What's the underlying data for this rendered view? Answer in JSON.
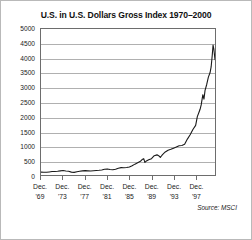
{
  "chart_data": {
    "type": "line",
    "title": "U.S. in U.S. Dollars Gross Index 1970–2000",
    "xlabel": "",
    "ylabel": "",
    "ylim": [
      0,
      5000
    ],
    "ytick_values": [
      0,
      500,
      1000,
      1500,
      2000,
      2500,
      3000,
      3500,
      4000,
      4500,
      5000
    ],
    "ytick_labels": [
      "0",
      "500",
      "1000",
      "1500",
      "2000",
      "2500",
      "3000",
      "3500",
      "4000",
      "4500",
      "5000"
    ],
    "xtick_labels": [
      {
        "line1": "Dec.",
        "line2": "'69"
      },
      {
        "line1": "Dec.",
        "line2": "'73"
      },
      {
        "line1": "Dec.",
        "line2": "'77"
      },
      {
        "line1": "Dec.",
        "line2": "'81"
      },
      {
        "line1": "Dec.",
        "line2": "'85"
      },
      {
        "line1": "Dec.",
        "line2": "'89"
      },
      {
        "line1": "Dec.",
        "line2": "'93"
      },
      {
        "line1": "Dec.",
        "line2": "'97"
      }
    ],
    "xtick_years": [
      1969,
      1973,
      1977,
      1981,
      1985,
      1989,
      1993,
      1997
    ],
    "xlim": [
      1969,
      2000.5
    ],
    "grid": true,
    "legend": false,
    "line_color": "#1a1a1a",
    "annotation": "Source: MSCI",
    "series": [
      {
        "name": "U.S. in U.S. Dollars Gross Index",
        "x": [
          1969.0,
          1969.5,
          1970.0,
          1970.5,
          1971.0,
          1971.5,
          1972.0,
          1972.5,
          1973.0,
          1973.5,
          1974.0,
          1974.5,
          1975.0,
          1975.5,
          1976.0,
          1976.5,
          1977.0,
          1977.5,
          1978.0,
          1978.5,
          1979.0,
          1979.5,
          1980.0,
          1980.5,
          1981.0,
          1981.5,
          1982.0,
          1982.5,
          1983.0,
          1983.5,
          1984.0,
          1984.5,
          1985.0,
          1985.5,
          1986.0,
          1986.5,
          1987.0,
          1987.3,
          1987.6,
          1987.8,
          1988.0,
          1988.5,
          1989.0,
          1989.5,
          1990.0,
          1990.3,
          1990.6,
          1990.8,
          1991.0,
          1991.5,
          1992.0,
          1992.5,
          1993.0,
          1993.5,
          1994.0,
          1994.5,
          1995.0,
          1995.5,
          1996.0,
          1996.5,
          1997.0,
          1997.3,
          1997.6,
          1997.8,
          1998.0,
          1998.3,
          1998.5,
          1998.7,
          1999.0,
          1999.3,
          1999.6,
          1999.8,
          2000.0,
          2000.15,
          2000.3,
          2000.5
        ],
        "y": [
          100,
          96,
          92,
          105,
          118,
          122,
          130,
          142,
          152,
          138,
          128,
          98,
          90,
          112,
          126,
          140,
          150,
          143,
          138,
          146,
          152,
          160,
          172,
          196,
          208,
          190,
          178,
          196,
          232,
          252,
          248,
          258,
          276,
          320,
          372,
          420,
          470,
          530,
          560,
          430,
          470,
          520,
          560,
          660,
          690,
          660,
          600,
          650,
          700,
          790,
          850,
          880,
          920,
          960,
          1000,
          1010,
          1050,
          1230,
          1380,
          1560,
          1700,
          2000,
          2150,
          2250,
          2400,
          2750,
          2600,
          2900,
          3100,
          3350,
          3500,
          3700,
          4100,
          4450,
          4300,
          3950
        ]
      }
    ]
  }
}
